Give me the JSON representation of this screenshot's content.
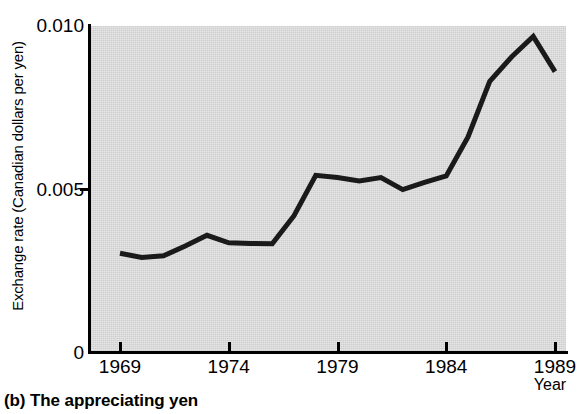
{
  "caption": "(b) The appreciating yen",
  "axes": {
    "ylabel": "Exchange rate (Canadian dollars per yen)",
    "xlabel": "Year",
    "ytick_labels": [
      "0.010",
      "0.005",
      "0"
    ],
    "xtick_labels": [
      "1969",
      "1974",
      "1979",
      "1984",
      "1989"
    ]
  },
  "colors": {
    "plot_background": "#cfcfcf",
    "line": "#1a1a1a",
    "axis": "#000000"
  },
  "chart_data": {
    "type": "line",
    "title": "(b) The appreciating yen",
    "xlabel": "Year",
    "ylabel": "Exchange rate (Canadian dollars per yen)",
    "xlim": [
      1969,
      1989
    ],
    "ylim": [
      0,
      0.01
    ],
    "yticks": [
      0,
      0.005,
      0.01
    ],
    "xticks": [
      1969,
      1974,
      1979,
      1984,
      1989
    ],
    "grid": false,
    "legend": "none",
    "x": [
      1969,
      1970,
      1971,
      1972,
      1973,
      1974,
      1975,
      1976,
      1977,
      1978,
      1979,
      1980,
      1981,
      1982,
      1983,
      1984,
      1985,
      1986,
      1987,
      1988,
      1989
    ],
    "values": [
      0.00303,
      0.0029,
      0.00295,
      0.00325,
      0.00358,
      0.00335,
      0.00333,
      0.00332,
      0.00418,
      0.00542,
      0.00535,
      0.00525,
      0.00535,
      0.00498,
      0.0052,
      0.0054,
      0.0066,
      0.0083,
      0.00905,
      0.00968,
      0.0086
    ],
    "series": [
      {
        "name": "Exchange rate (Canadian dollars per yen)",
        "values": [
          0.00303,
          0.0029,
          0.00295,
          0.00325,
          0.00358,
          0.00335,
          0.00333,
          0.00332,
          0.00418,
          0.00542,
          0.00535,
          0.00525,
          0.00535,
          0.00498,
          0.0052,
          0.0054,
          0.0066,
          0.0083,
          0.00905,
          0.00968,
          0.0086
        ]
      }
    ]
  }
}
